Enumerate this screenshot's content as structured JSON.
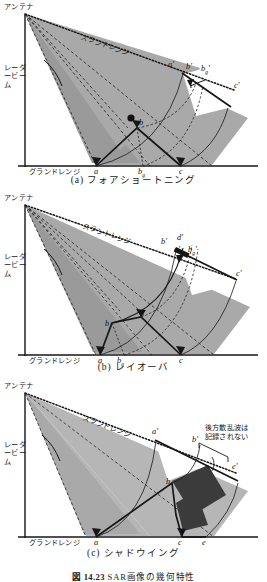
{
  "figure": {
    "number": "図 14.23",
    "title": "SAR画像の幾何特性",
    "panels": [
      {
        "id": "a",
        "caption": "(a) フォアショートニング",
        "labels": {
          "antenna": "アンテナ",
          "radar_beam": "レーダービーム",
          "slant_range": "スラントレンジ",
          "ground_range": "グランドレンジ"
        },
        "ground_points": [
          "a",
          "b",
          "c"
        ],
        "ground_point_sub": "g",
        "slant_points": [
          "a'",
          "b'",
          "b",
          "c'"
        ],
        "slant_point_sub": "g",
        "terrain_peak": "b"
      },
      {
        "id": "b",
        "caption": "(b) レイオーバ",
        "labels": {
          "antenna": "アンテナ",
          "radar_beam": "レーダービーム",
          "slant_range": "スラントレンジ",
          "ground_range": "グランドレンジ"
        },
        "ground_points": [
          "a",
          "b",
          "c"
        ],
        "ground_point_sub": "g",
        "slant_points": [
          "b'",
          "d'",
          "a'",
          "b",
          "c'"
        ],
        "slant_point_sub": "g",
        "terrain_points": [
          "b",
          "d"
        ]
      },
      {
        "id": "c",
        "caption": "(c) シャドウイング",
        "labels": {
          "antenna": "アンテナ",
          "radar_beam": "レーダービーム",
          "slant_range": "スラントレンジ",
          "ground_range": "グランドレンジ"
        },
        "ground_points": [
          "a",
          "c",
          "e"
        ],
        "slant_points": [
          "a'",
          "b'",
          "e'"
        ],
        "terrain_peak": "b",
        "annotation_line1": "後方散乱波は",
        "annotation_line2": "記録されない"
      }
    ]
  },
  "colors": {
    "ink": "#161616",
    "beam_fill": "#a9a9a9",
    "beam_fill_light": "#b9b9b9",
    "shadow_fill": "#3b3b3b",
    "paper": "#ffffff"
  }
}
